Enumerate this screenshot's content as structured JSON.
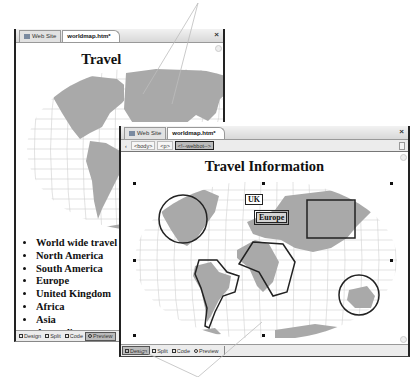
{
  "back_window": {
    "tabs": [
      {
        "label": "Web Site",
        "icon": "website-icon",
        "active": false
      },
      {
        "label": "worldmap.htm*",
        "active": true
      }
    ],
    "close_label": "×",
    "page_title": "Travel Information",
    "map_labels": {
      "uk": "UK",
      "europe": "Europe"
    },
    "list_items": [
      "World wide travel",
      "North America",
      "South America",
      "Europe",
      "United Kingdom",
      "Africa",
      "Asia",
      "Australia"
    ],
    "view_buttons": [
      {
        "label": "Design",
        "active": false
      },
      {
        "label": "Split",
        "active": false
      },
      {
        "label": "Code",
        "active": false
      },
      {
        "label": "Preview",
        "active": true
      }
    ]
  },
  "front_window": {
    "tabs": [
      {
        "label": "Web Site",
        "icon": "website-icon",
        "active": false
      },
      {
        "label": "worldmap.htm*",
        "active": true
      }
    ],
    "close_label": "×",
    "breadcrumbs": [
      "<body>",
      "<p>",
      "<!--webbot-->"
    ],
    "selected_breadcrumb": "<!--webbot-->",
    "page_title": "Travel Information",
    "map_labels": {
      "uk": "UK",
      "europe": "Europe"
    },
    "hotspots": [
      "north-america-circle",
      "south-america-polygon",
      "africa-polygon",
      "asia-rectangle",
      "australia-circle",
      "uk-label",
      "europe-label"
    ],
    "view_buttons": [
      {
        "label": "Design",
        "active": true
      },
      {
        "label": "Split",
        "active": false
      },
      {
        "label": "Code",
        "active": false
      },
      {
        "label": "Preview",
        "active": false
      }
    ]
  },
  "colors": {
    "land": "#a9a9a9",
    "grid": "#c8c8c8",
    "frame": "#222222",
    "chrome": "#e0e0e0"
  }
}
